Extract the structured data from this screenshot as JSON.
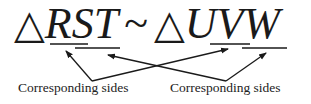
{
  "statement": {
    "triangle_symbol": "△",
    "first_triangle": "RST",
    "similar_symbol": "~",
    "second_triangle": "UVW"
  },
  "labels": {
    "left": "Corresponding sides",
    "right": "Corresponding sides"
  },
  "underlines": [
    {
      "segment": "RS"
    },
    {
      "segment": "ST"
    },
    {
      "segment": "UV"
    },
    {
      "segment": "VW"
    }
  ],
  "colors": {
    "ink": "#1a1a1a",
    "background": "#ffffff"
  }
}
